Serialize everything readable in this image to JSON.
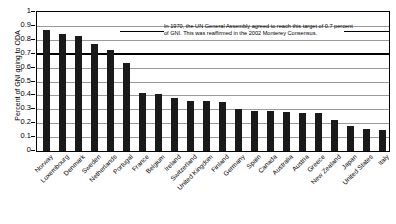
{
  "chart_data": {
    "type": "bar",
    "title": "",
    "xlabel": "",
    "ylabel": "Percent of GNI going to ODA",
    "ylim": [
      0,
      1
    ],
    "ytick_step": 0.1,
    "grid": true,
    "legend": "none",
    "yticks": [
      "0",
      "0.1",
      "0.2",
      "0.3",
      "0.4",
      "0.5",
      "0.6",
      "0.7",
      "0.8",
      "0.9",
      "1"
    ],
    "categories": [
      "Norway",
      "Luxembourg",
      "Denmark",
      "Sweden",
      "Netherlands",
      "Portugal",
      "France",
      "Belgium",
      "Ireland",
      "Switzerland",
      "United Kingdom",
      "Finland",
      "Germany",
      "Spain",
      "Canada",
      "Australia",
      "Austria",
      "Greece",
      "New Zealand",
      "Japan",
      "United States",
      "Italy"
    ],
    "values": [
      0.87,
      0.84,
      0.83,
      0.77,
      0.73,
      0.63,
      0.42,
      0.41,
      0.38,
      0.36,
      0.36,
      0.35,
      0.3,
      0.29,
      0.29,
      0.28,
      0.27,
      0.27,
      0.22,
      0.18,
      0.16,
      0.15
    ],
    "reference_line": {
      "value": 0.7,
      "label": "0.7 percent of GNI target"
    },
    "annotation": {
      "line1": "In 1970, the UN General Assembly agreed to reach this target of 0.7 percent",
      "line2": "of GNI. This was reaffirmed in the 2002 Monterey Consensus."
    },
    "colors": {
      "bar": "#1a1a1a",
      "grid": "#9a9a9a",
      "axis": "#000000",
      "reference_line": "#000000",
      "background": "#ffffff"
    }
  }
}
